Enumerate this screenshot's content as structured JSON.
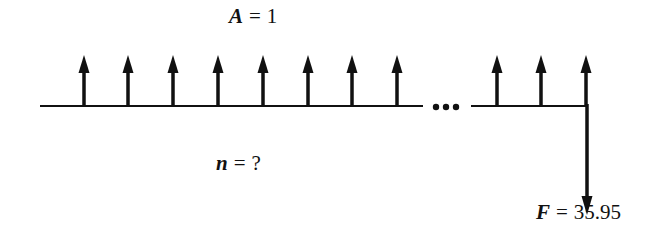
{
  "diagram": {
    "type": "cash-flow-diagram",
    "annuity_label": {
      "variable": "A",
      "operator": "=",
      "value": "1"
    },
    "periods_label": {
      "variable": "n",
      "operator": "=",
      "value": "?"
    },
    "future_value_label": {
      "variable": "F",
      "operator": "=",
      "value": "35.95"
    },
    "ellipsis": "•••",
    "arrows_up_count_shown": 11,
    "arrows_up_before_gap": 8,
    "arrows_up_after_gap": 3,
    "arrow_down_count": 1,
    "color": "#111111"
  }
}
